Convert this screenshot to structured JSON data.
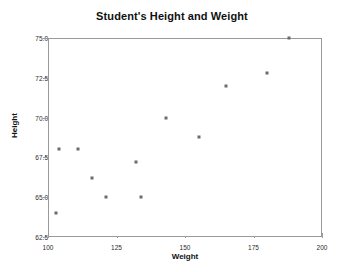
{
  "chart_data": {
    "type": "scatter",
    "title": "Student's Height and Weight",
    "xlabel": "Weight",
    "ylabel": "Height",
    "xlim": [
      100,
      200
    ],
    "ylim": [
      62.5,
      75.0
    ],
    "xticks": [
      100,
      125,
      150,
      175,
      200
    ],
    "yticks": [
      "62.5",
      "65.0",
      "67.5",
      "70.0",
      "72.5",
      "75.0"
    ],
    "grid": false,
    "legend": null,
    "marker": "square",
    "marker_color": "#6b6b6b",
    "points": [
      {
        "x": 103,
        "y": 64.0
      },
      {
        "x": 104,
        "y": 68.0
      },
      {
        "x": 111,
        "y": 68.0
      },
      {
        "x": 116,
        "y": 66.2
      },
      {
        "x": 121,
        "y": 65.0
      },
      {
        "x": 132,
        "y": 67.2
      },
      {
        "x": 134,
        "y": 65.0
      },
      {
        "x": 143,
        "y": 70.0
      },
      {
        "x": 155,
        "y": 68.8
      },
      {
        "x": 165,
        "y": 72.0
      },
      {
        "x": 180,
        "y": 72.8
      },
      {
        "x": 188,
        "y": 75.0
      }
    ]
  }
}
